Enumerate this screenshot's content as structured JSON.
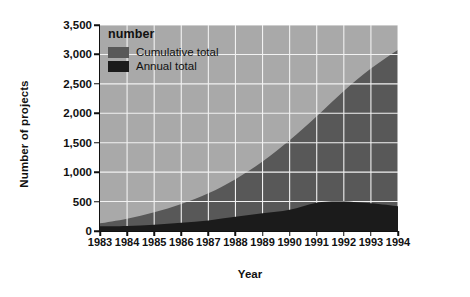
{
  "chart_data": {
    "type": "area",
    "title": "",
    "xlabel": "Year",
    "ylabel": "Number of projects",
    "legend_title": "number",
    "legend_position": "top-left-inside",
    "grid": true,
    "categories": [
      1983,
      1984,
      1985,
      1986,
      1987,
      1988,
      1989,
      1990,
      1991,
      1992,
      1993,
      1994
    ],
    "x": [
      "1983",
      "1984",
      "1985",
      "1986",
      "1987",
      "1988",
      "1989",
      "1990",
      "1991",
      "1992",
      "1993",
      "1994"
    ],
    "xlim": [
      1983,
      1994
    ],
    "ylim": [
      0,
      3500
    ],
    "yticks": [
      0,
      500,
      1000,
      1500,
      2000,
      2500,
      3000,
      3500
    ],
    "ytick_labels": [
      "0",
      "500",
      "1,000",
      "1,500",
      "2,000",
      "2,500",
      "3,000",
      "3,500"
    ],
    "series": [
      {
        "name": "Cumulative total",
        "color": "#585858",
        "values": [
          130,
          210,
          320,
          460,
          640,
          880,
          1180,
          1540,
          1950,
          2380,
          2760,
          3080
        ]
      },
      {
        "name": "Annual total",
        "color": "#1b1b1b",
        "values": [
          80,
          85,
          105,
          140,
          180,
          240,
          300,
          360,
          480,
          500,
          470,
          420
        ]
      }
    ],
    "colors": {
      "plot_background": "#a9a9a9",
      "grid": "#f2f2f2",
      "cumulative": "#585858",
      "annual": "#1b1b1b",
      "axis": "#111111",
      "page_background": "#ffffff"
    }
  },
  "axes": {
    "y_title": "Number of projects",
    "x_title": "Year"
  },
  "legend": {
    "title": "number",
    "items": [
      {
        "label": "Cumulative total",
        "color": "#585858"
      },
      {
        "label": "Annual total",
        "color": "#1b1b1b"
      }
    ]
  }
}
